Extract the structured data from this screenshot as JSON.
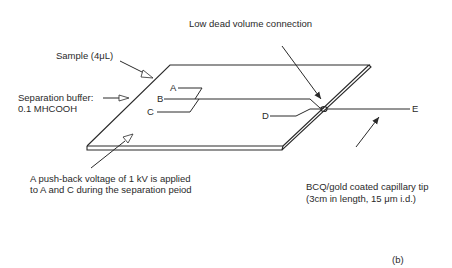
{
  "figure": {
    "panel_label": "(b)",
    "colors": {
      "line": "#2a2a2a",
      "background": "#ffffff",
      "hollow_arrow": "#ffffff"
    }
  },
  "labels": {
    "low_dead_volume": "Low dead volume connection",
    "sample": "Sample (4μL)",
    "separation_buffer_line1": "Separation buffer:",
    "separation_buffer_line2": "0.1 MHCOOH",
    "push_back_line1": "A push-back voltage of 1 kV is applied",
    "push_back_line2": "to A and C during the separation peiod",
    "capillary_line1": "BCQ/gold coated capillary tip",
    "capillary_line2": "(3cm in length, 15 μm i.d.)"
  },
  "channels": {
    "A": "A",
    "B": "B",
    "C": "C",
    "D": "D",
    "E": "E"
  }
}
